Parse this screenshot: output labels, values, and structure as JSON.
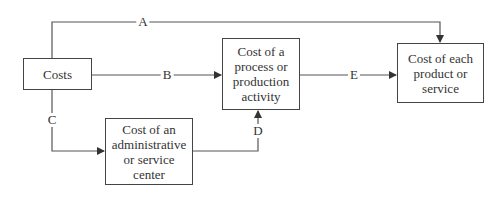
{
  "diagram": {
    "nodes": {
      "costs": "Costs",
      "process": "Cost of a process or production activity",
      "product": "Cost of each product or service",
      "admin": "Cost of an administrative or service center"
    },
    "edges": {
      "a": "A",
      "b": "B",
      "c": "C",
      "d": "D",
      "e": "E"
    }
  },
  "colors": {
    "line": "#444444",
    "text": "#333333"
  }
}
